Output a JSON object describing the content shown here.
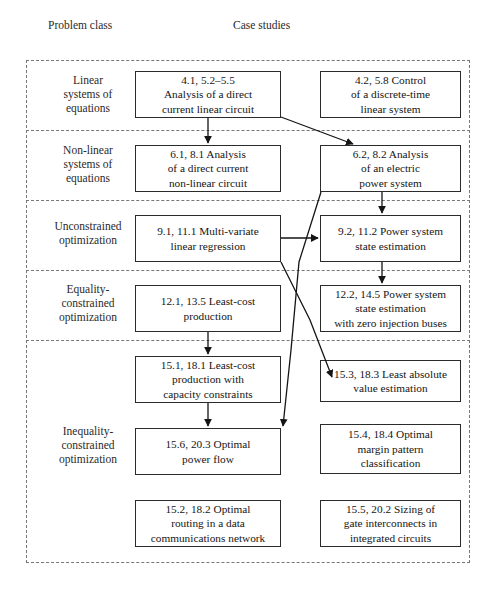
{
  "headers": {
    "problem_class": "Problem class",
    "case_studies": "Case studies"
  },
  "classes": [
    {
      "id": "linear-systems",
      "label": "Linear\nsystems of\nequations"
    },
    {
      "id": "non-linear-systems",
      "label": "Non-linear\nsystems of\nequations"
    },
    {
      "id": "unconstrained",
      "label": "Unconstrained\noptimization"
    },
    {
      "id": "equality-constrained",
      "label": "Equality-\nconstrained\noptimization"
    },
    {
      "id": "inequality-constrained",
      "label": "Inequality-\nconstrained\noptimization"
    }
  ],
  "cases": [
    {
      "id": "c1",
      "label": "4.1, 5.2–5.5\nAnalysis of a direct\ncurrent linear circuit"
    },
    {
      "id": "c2",
      "label": "4.2, 5.8 Control\nof a discrete-time\nlinear system"
    },
    {
      "id": "c3",
      "label": "6.1, 8.1 Analysis\nof a direct current\nnon-linear circuit"
    },
    {
      "id": "c4",
      "label": "6.2, 8.2 Analysis\nof an electric\npower system"
    },
    {
      "id": "c5",
      "label": "9.1, 11.1 Multi-variate\nlinear regression"
    },
    {
      "id": "c6",
      "label": "9.2, 11.2 Power system\nstate estimation"
    },
    {
      "id": "c7",
      "label": "12.1, 13.5 Least-cost\nproduction"
    },
    {
      "id": "c8",
      "label": "12.2, 14.5 Power system\nstate estimation\nwith zero injection buses"
    },
    {
      "id": "c9",
      "label": "15.1, 18.1 Least-cost\nproduction with\ncapacity constraints"
    },
    {
      "id": "c10",
      "label": "15.3, 18.3 Least absolute\nvalue estimation"
    },
    {
      "id": "c11",
      "label": "15.6, 20.3 Optimal\npower flow"
    },
    {
      "id": "c12",
      "label": "15.4, 18.4 Optimal\nmargin pattern\nclassification"
    },
    {
      "id": "c13",
      "label": "15.2, 18.2 Optimal\nrouting in a data\ncommunications network"
    },
    {
      "id": "c14",
      "label": "15.5, 20.2 Sizing of\ngate interconnects in\nintegrated circuits"
    }
  ],
  "colors": {
    "box_border": "#2b2b2b",
    "dashed_border": "#777777",
    "arrow": "#151515",
    "text": "#151515",
    "background": "#ffffff"
  },
  "chart_data": {
    "type": "diagram",
    "columns": [
      "Problem class",
      "Case studies"
    ],
    "rows": [
      {
        "class": "Linear systems of equations",
        "cases": [
          "4.1, 5.2–5.5 Analysis of a direct current linear circuit",
          "4.2, 5.8 Control of a discrete-time linear system"
        ]
      },
      {
        "class": "Non-linear systems of equations",
        "cases": [
          "6.1, 8.1 Analysis of a direct current non-linear circuit",
          "6.2, 8.2 Analysis of an electric power system"
        ]
      },
      {
        "class": "Unconstrained optimization",
        "cases": [
          "9.1, 11.1 Multi-variate linear regression",
          "9.2, 11.2 Power system state estimation"
        ]
      },
      {
        "class": "Equality-constrained optimization",
        "cases": [
          "12.1, 13.5 Least-cost production",
          "12.2, 14.5 Power system state estimation with zero injection buses"
        ]
      },
      {
        "class": "Inequality-constrained optimization",
        "cases": [
          "15.1, 18.1 Least-cost production with capacity constraints",
          "15.3, 18.3 Least absolute value estimation",
          "15.6, 20.3 Optimal power flow",
          "15.4, 18.4 Optimal margin pattern classification",
          "15.2, 18.2 Optimal routing in a data communications network",
          "15.5, 20.2 Sizing of gate interconnects in integrated circuits"
        ]
      }
    ],
    "edges": [
      {
        "from": "4.1, 5.2–5.5 Analysis of a direct current linear circuit",
        "to": "6.1, 8.1 Analysis of a direct current non-linear circuit"
      },
      {
        "from": "4.1, 5.2–5.5 Analysis of a direct current linear circuit",
        "to": "6.2, 8.2 Analysis of an electric power system"
      },
      {
        "from": "6.2, 8.2 Analysis of an electric power system",
        "to": "9.2, 11.2 Power system state estimation"
      },
      {
        "from": "6.2, 8.2 Analysis of an electric power system",
        "to": "15.6, 20.3 Optimal power flow"
      },
      {
        "from": "9.1, 11.1 Multi-variate linear regression",
        "to": "9.2, 11.2 Power system state estimation"
      },
      {
        "from": "9.1, 11.1 Multi-variate linear regression",
        "to": "15.3, 18.3 Least absolute value estimation"
      },
      {
        "from": "9.2, 11.2 Power system state estimation",
        "to": "12.2, 14.5 Power system state estimation with zero injection buses"
      },
      {
        "from": "12.1, 13.5 Least-cost production",
        "to": "15.1, 18.1 Least-cost production with capacity constraints"
      },
      {
        "from": "15.1, 18.1 Least-cost production with capacity constraints",
        "to": "15.6, 20.3 Optimal power flow"
      }
    ]
  }
}
